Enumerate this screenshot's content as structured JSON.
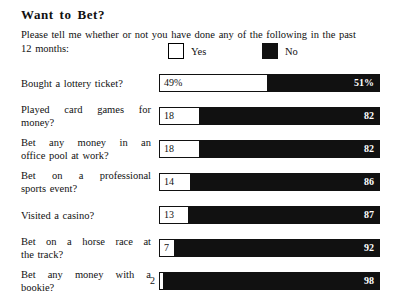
{
  "header": {
    "title": "Want to Bet?",
    "subtitle_line1": "Please tell me whether or not you have done any of the following in the past",
    "subtitle_line2": "12 months:"
  },
  "legend": {
    "yes": {
      "label": "Yes",
      "swatch": "white-square",
      "color": "#ffffff"
    },
    "no": {
      "label": "No",
      "swatch": "black-square",
      "color": "#111111"
    }
  },
  "chart_data": {
    "type": "bar",
    "orientation": "horizontal",
    "stacked": true,
    "title": "Want to Bet?",
    "subtitle": "Please tell me whether or not you have done any of the following in the past 12 months:",
    "xlabel": "",
    "ylabel": "",
    "xlim": [
      0,
      100
    ],
    "grid": false,
    "legend_position": "top",
    "legend": [
      "Yes",
      "No"
    ],
    "categories": [
      "Bought a lottery ticket?",
      "Played card games for money?",
      "Bet any money in an office pool at work?",
      "Bet on a professional sports event?",
      "Visited a casino?",
      "Bet on a horse race at the track?",
      "Bet any money with a bookie?"
    ],
    "series": [
      {
        "name": "Yes",
        "values": [
          49,
          18,
          18,
          14,
          13,
          7,
          2
        ]
      },
      {
        "name": "No",
        "values": [
          51,
          82,
          82,
          86,
          87,
          92,
          98
        ]
      }
    ]
  },
  "rows": [
    {
      "label_lines": [
        "Bought a lottery ticket?"
      ],
      "yes_value": 49,
      "no_value": 51,
      "yes_label": "49%",
      "no_label": "51%",
      "yes_label_outside": false,
      "top": 74
    },
    {
      "label_lines": [
        "Played card games for",
        "money?"
      ],
      "yes_value": 18,
      "no_value": 82,
      "yes_label": "18",
      "no_label": "82",
      "yes_label_outside": false,
      "top": 107
    },
    {
      "label_lines": [
        "Bet any money in an",
        "office pool at work?"
      ],
      "yes_value": 18,
      "no_value": 82,
      "yes_label": "18",
      "no_label": "82",
      "yes_label_outside": false,
      "top": 140
    },
    {
      "label_lines": [
        "Bet on a professional",
        "sports event?"
      ],
      "yes_value": 14,
      "no_value": 86,
      "yes_label": "14",
      "no_label": "86",
      "yes_label_outside": false,
      "top": 173
    },
    {
      "label_lines": [
        "Visited a casino?"
      ],
      "yes_value": 13,
      "no_value": 87,
      "yes_label": "13",
      "no_label": "87",
      "yes_label_outside": false,
      "top": 206
    },
    {
      "label_lines": [
        "Bet on a horse race at",
        "the track?"
      ],
      "yes_value": 7,
      "no_value": 92,
      "yes_label": "7",
      "no_label": "92",
      "yes_label_outside": false,
      "top": 239
    },
    {
      "label_lines": [
        "Bet any money with a",
        "bookie?"
      ],
      "yes_value": 2,
      "no_value": 98,
      "yes_label": "2",
      "no_label": "98",
      "yes_label_outside": true,
      "top": 272
    }
  ]
}
